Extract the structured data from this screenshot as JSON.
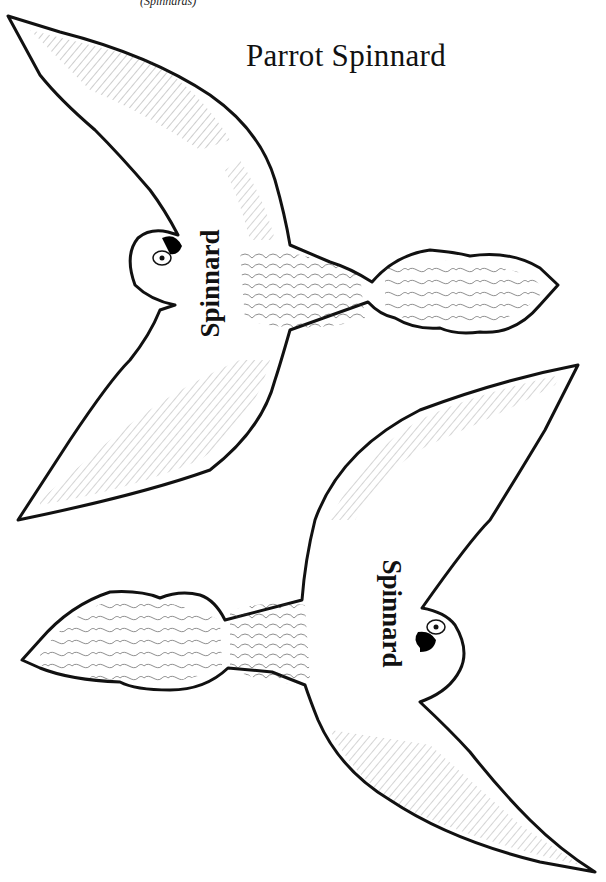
{
  "page": {
    "subtitle_fragment": "(Spinnards)",
    "title": "Parrot Spinnard"
  },
  "birds": [
    {
      "label": "Spinnard",
      "orientation": "head-left, tail-right",
      "position": "top"
    },
    {
      "label": "Spinnard",
      "orientation": "head-right, tail-left",
      "position": "bottom"
    }
  ],
  "style": {
    "line_color": "#111111",
    "background": "#ffffff",
    "beak_color": "#000000"
  }
}
